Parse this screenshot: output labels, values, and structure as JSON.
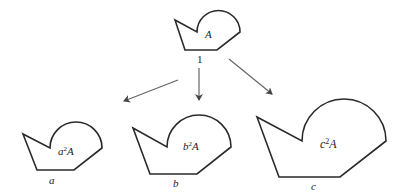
{
  "diagram": {
    "top": {
      "label": "A",
      "scale_label": "1"
    },
    "children": [
      {
        "label_base": "a",
        "label_sup": "2",
        "label_tail": "A",
        "scale_label": "a"
      },
      {
        "label_base": "b",
        "label_sup": "2",
        "label_tail": "A",
        "scale_label": "b"
      },
      {
        "label_base": "c",
        "label_sup": "2",
        "label_tail": "A",
        "scale_label": "c"
      }
    ],
    "colors": {
      "stroke": "#2a2a2a",
      "arrow": "#666666"
    }
  }
}
